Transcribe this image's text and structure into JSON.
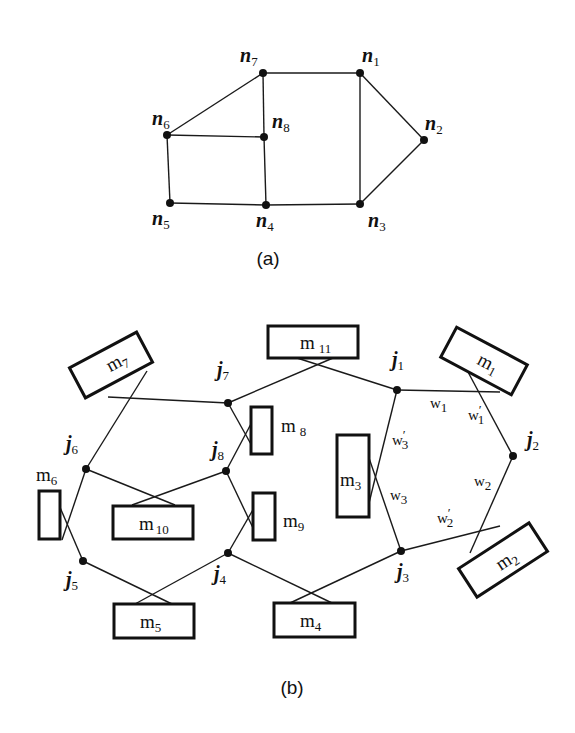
{
  "figure_a": {
    "caption": "(a)",
    "nodes": [
      {
        "id": "n1",
        "base": "n",
        "sub": "1"
      },
      {
        "id": "n2",
        "base": "n",
        "sub": "2"
      },
      {
        "id": "n3",
        "base": "n",
        "sub": "3"
      },
      {
        "id": "n4",
        "base": "n",
        "sub": "4"
      },
      {
        "id": "n5",
        "base": "n",
        "sub": "5"
      },
      {
        "id": "n6",
        "base": "n",
        "sub": "6"
      },
      {
        "id": "n7",
        "base": "n",
        "sub": "7"
      },
      {
        "id": "n8",
        "base": "n",
        "sub": "8"
      }
    ],
    "edges": [
      [
        "n7",
        "n1"
      ],
      [
        "n1",
        "n2"
      ],
      [
        "n2",
        "n3"
      ],
      [
        "n1",
        "n3"
      ],
      [
        "n7",
        "n6"
      ],
      [
        "n7",
        "n8"
      ],
      [
        "n6",
        "n8"
      ],
      [
        "n8",
        "n4"
      ],
      [
        "n6",
        "n5"
      ],
      [
        "n5",
        "n4"
      ],
      [
        "n4",
        "n3"
      ]
    ]
  },
  "figure_b": {
    "caption": "(b)",
    "junctions": [
      {
        "id": "j1",
        "base": "j",
        "sub": "1"
      },
      {
        "id": "j2",
        "base": "j",
        "sub": "2"
      },
      {
        "id": "j3",
        "base": "j",
        "sub": "3"
      },
      {
        "id": "j4",
        "base": "j",
        "sub": "4"
      },
      {
        "id": "j5",
        "base": "j",
        "sub": "5"
      },
      {
        "id": "j6",
        "base": "j",
        "sub": "6"
      },
      {
        "id": "j7",
        "base": "j",
        "sub": "7"
      },
      {
        "id": "j8",
        "base": "j",
        "sub": "8"
      }
    ],
    "modules": [
      {
        "id": "m1",
        "base": "m",
        "sub": "1"
      },
      {
        "id": "m2",
        "base": "m",
        "sub": "2"
      },
      {
        "id": "m3",
        "base": "m",
        "sub": "3"
      },
      {
        "id": "m4",
        "base": "m",
        "sub": "4"
      },
      {
        "id": "m5",
        "base": "m",
        "sub": "5"
      },
      {
        "id": "m6",
        "base": "m",
        "sub": "6"
      },
      {
        "id": "m7",
        "base": "m",
        "sub": "7"
      },
      {
        "id": "m8",
        "base": "m",
        "sub": "8"
      },
      {
        "id": "m9",
        "base": "m",
        "sub": "9"
      },
      {
        "id": "m10",
        "base": "m",
        "sub": "10"
      },
      {
        "id": "m11",
        "base": "m",
        "sub": "11"
      }
    ],
    "wire_labels": [
      {
        "id": "w1",
        "base": "w",
        "sub": "1",
        "prime": ""
      },
      {
        "id": "w1p",
        "base": "w",
        "sub": "1",
        "prime": "′"
      },
      {
        "id": "w2",
        "base": "w",
        "sub": "2",
        "prime": ""
      },
      {
        "id": "w2p",
        "base": "w",
        "sub": "2",
        "prime": "′"
      },
      {
        "id": "w3",
        "base": "w",
        "sub": "3",
        "prime": ""
      },
      {
        "id": "w3p",
        "base": "w",
        "sub": "3",
        "prime": "′"
      }
    ]
  }
}
